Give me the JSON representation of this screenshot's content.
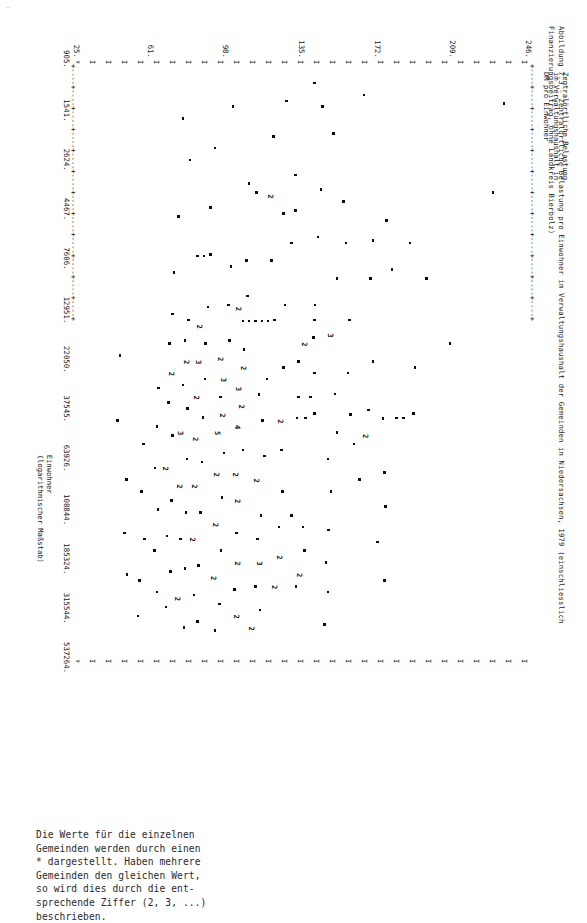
{
  "page": {
    "corner_mark": "…"
  },
  "figure": {
    "title": "Abbildung 7.3 - Zentralörtliche Belastung pro Einwohner im Verwaltungshaushalt der Gemeinden in Niedersachsen, 1979 (einschliesslich Finanzierungsbeitrag, ohne Landkreis Bierbolz)",
    "note": "Die Werte für die einzelnen\nGemeinden werden durch einen\n* dargestellt. Haben mehrere\nGemeinden den gleichen Wert,\nso wird dies durch die ent-\nsprechende Ziffer (2, 3, ...)\nbeschrieben.",
    "ylabel": "Zentralörtliche Belastung\nim Verwaltungshaushalt in\nDM pro Einwohner",
    "xlabel": "Einwohner\n(logarithmischer Maßstab)",
    "frame_char_top": "+----+----+----+----+----+----+----+----+----+----+----+----+",
    "frame_char_bottom": "+----+----+----+----+----+----+----+----+----+----+----+----+",
    "frame_char_side": "I I I I I I I I I I I I I I I I I I I I I I I I I I I I I I I I I I I I I I I I I I I I I",
    "point_marker_star": "*",
    "ink_color": "#111111"
  },
  "chart_data": {
    "type": "scatter",
    "title": "Abbildung 7.3 - Zentralörtliche Belastung pro Einwohner im Verwaltungshaushalt der Gemeinden in Niedersachsen, 1979 (einschliesslich Finanzierungsbeitrag, ohne Landkreis Bierbolz)",
    "xlabel": "Einwohner (logarithmischer Maßstab)",
    "ylabel": "Zentralörtliche Belastung im Verwaltungshaushalt in DM pro Einwohner",
    "xscale": "log",
    "yscale": "linear",
    "grid": false,
    "legend": null,
    "xticks": [
      905,
      1541,
      2624,
      4467,
      7606,
      12951,
      22050,
      37545,
      63926,
      108844,
      185324,
      315544,
      537264
    ],
    "xtick_labels": [
      "905.",
      "1541.",
      "2624.",
      "4467.",
      "7606.",
      "12951.",
      "22050.",
      "37545.",
      "63926.",
      "108844.",
      "185324.",
      "315544.",
      "537264."
    ],
    "yticks": [
      246,
      209,
      172,
      135,
      98,
      61,
      25
    ],
    "ytick_labels": [
      "246.",
      "209.",
      "172.",
      "135.",
      "98.",
      "61.",
      "25."
    ],
    "xlim": [
      905,
      537264
    ],
    "ylim": [
      25,
      246
    ],
    "marker": "*",
    "overplot_note": "Digits 2,3,4,5 denote the number of coincident municipalities at that cell.",
    "points": [
      {
        "x": 0.215,
        "y": 0.075,
        "m": "*"
      },
      {
        "x": 0.065,
        "y": 0.05,
        "m": "*"
      },
      {
        "x": 0.47,
        "y": 0.17,
        "m": "*"
      },
      {
        "x": 0.36,
        "y": 0.222,
        "m": "*"
      },
      {
        "x": 0.3,
        "y": 0.258,
        "m": "*"
      },
      {
        "x": 0.51,
        "y": 0.247,
        "m": "*"
      },
      {
        "x": 0.588,
        "y": 0.25,
        "m": "*"
      },
      {
        "x": 0.596,
        "y": 0.272,
        "m": "*"
      },
      {
        "x": 0.596,
        "y": 0.288,
        "m": "*"
      },
      {
        "x": 0.262,
        "y": 0.31,
        "m": "*"
      },
      {
        "x": 0.345,
        "y": 0.298,
        "m": "*"
      },
      {
        "x": 0.597,
        "y": 0.318,
        "m": "*"
      },
      {
        "x": 0.688,
        "y": 0.315,
        "m": "*"
      },
      {
        "x": 0.745,
        "y": 0.312,
        "m": "*"
      },
      {
        "x": 0.805,
        "y": 0.33,
        "m": "*"
      },
      {
        "x": 0.87,
        "y": 0.315,
        "m": "*"
      },
      {
        "x": 0.296,
        "y": 0.34,
        "m": "*"
      },
      {
        "x": 0.36,
        "y": 0.345,
        "m": "*"
      },
      {
        "x": 0.5,
        "y": 0.34,
        "m": "*"
      },
      {
        "x": 0.582,
        "y": 0.35,
        "m": "*"
      },
      {
        "x": 0.625,
        "y": 0.352,
        "m": "2"
      },
      {
        "x": 0.7,
        "y": 0.37,
        "m": "*"
      },
      {
        "x": 0.64,
        "y": 0.382,
        "m": "*"
      },
      {
        "x": 0.59,
        "y": 0.39,
        "m": "*"
      },
      {
        "x": 0.52,
        "y": 0.395,
        "m": "*"
      },
      {
        "x": 0.43,
        "y": 0.392,
        "m": "*"
      },
      {
        "x": 0.3,
        "y": 0.4,
        "m": "*"
      },
      {
        "x": 0.23,
        "y": 0.405,
        "m": "*"
      },
      {
        "x": 0.36,
        "y": 0.42,
        "m": "*"
      },
      {
        "x": 0.115,
        "y": 0.428,
        "m": "*"
      },
      {
        "x": 0.455,
        "y": 0.43,
        "m": "3"
      },
      {
        "x": 0.555,
        "y": 0.424,
        "m": "*"
      },
      {
        "x": 0.62,
        "y": 0.42,
        "m": "*"
      },
      {
        "x": 0.665,
        "y": 0.44,
        "m": "*"
      },
      {
        "x": 0.72,
        "y": 0.433,
        "m": "*"
      },
      {
        "x": 0.785,
        "y": 0.438,
        "m": "*"
      },
      {
        "x": 0.84,
        "y": 0.444,
        "m": "*"
      },
      {
        "x": 0.89,
        "y": 0.44,
        "m": "*"
      },
      {
        "x": 0.945,
        "y": 0.448,
        "m": "*"
      },
      {
        "x": 0.07,
        "y": 0.452,
        "m": "*"
      },
      {
        "x": 0.21,
        "y": 0.455,
        "m": "*"
      },
      {
        "x": 0.29,
        "y": 0.462,
        "m": "*"
      },
      {
        "x": 0.405,
        "y": 0.468,
        "m": "*"
      },
      {
        "x": 0.43,
        "y": 0.47,
        "m": "*"
      },
      {
        "x": 0.46,
        "y": 0.472,
        "m": "*"
      },
      {
        "x": 0.47,
        "y": 0.486,
        "m": "2"
      },
      {
        "x": 0.52,
        "y": 0.47,
        "m": "*"
      },
      {
        "x": 0.56,
        "y": 0.478,
        "m": "*"
      },
      {
        "x": 0.588,
        "y": 0.47,
        "m": "*"
      },
      {
        "x": 0.596,
        "y": 0.49,
        "m": "*"
      },
      {
        "x": 0.56,
        "y": 0.505,
        "m": "*"
      },
      {
        "x": 0.596,
        "y": 0.508,
        "m": "*"
      },
      {
        "x": 0.5,
        "y": 0.505,
        "m": "*"
      },
      {
        "x": 0.78,
        "y": 0.495,
        "m": "*"
      },
      {
        "x": 0.82,
        "y": 0.492,
        "m": "*"
      },
      {
        "x": 0.86,
        "y": 0.497,
        "m": "2"
      },
      {
        "x": 0.88,
        "y": 0.51,
        "m": "*"
      },
      {
        "x": 0.76,
        "y": 0.52,
        "m": "*"
      },
      {
        "x": 0.185,
        "y": 0.512,
        "m": "*"
      },
      {
        "x": 0.245,
        "y": 0.512,
        "m": "*"
      },
      {
        "x": 0.3,
        "y": 0.52,
        "m": "*"
      },
      {
        "x": 0.06,
        "y": 0.532,
        "m": "*"
      },
      {
        "x": 0.25,
        "y": 0.538,
        "m": "*"
      },
      {
        "x": 0.405,
        "y": 0.535,
        "m": "*"
      },
      {
        "x": 0.51,
        "y": 0.538,
        "m": "*"
      },
      {
        "x": 0.6,
        "y": 0.54,
        "m": "2"
      },
      {
        "x": 0.65,
        "y": 0.543,
        "m": "*"
      },
      {
        "x": 0.72,
        "y": 0.54,
        "m": "*"
      },
      {
        "x": 0.78,
        "y": 0.548,
        "m": "*"
      },
      {
        "x": 0.83,
        "y": 0.542,
        "m": "2"
      },
      {
        "x": 0.88,
        "y": 0.552,
        "m": "2"
      },
      {
        "x": 0.12,
        "y": 0.56,
        "m": "*"
      },
      {
        "x": 0.22,
        "y": 0.562,
        "m": "2"
      },
      {
        "x": 0.33,
        "y": 0.565,
        "m": "*"
      },
      {
        "x": 0.43,
        "y": 0.558,
        "m": "*"
      },
      {
        "x": 0.432,
        "y": 0.572,
        "m": "*"
      },
      {
        "x": 0.432,
        "y": 0.586,
        "m": "*"
      },
      {
        "x": 0.432,
        "y": 0.6,
        "m": "*"
      },
      {
        "x": 0.432,
        "y": 0.614,
        "m": "*"
      },
      {
        "x": 0.432,
        "y": 0.628,
        "m": "*"
      },
      {
        "x": 0.53,
        "y": 0.575,
        "m": "*"
      },
      {
        "x": 0.556,
        "y": 0.592,
        "m": "*"
      },
      {
        "x": 0.6,
        "y": 0.585,
        "m": "*"
      },
      {
        "x": 0.66,
        "y": 0.58,
        "m": "*"
      },
      {
        "x": 0.7,
        "y": 0.592,
        "m": "2"
      },
      {
        "x": 0.76,
        "y": 0.588,
        "m": "*"
      },
      {
        "x": 0.8,
        "y": 0.596,
        "m": "*"
      },
      {
        "x": 0.84,
        "y": 0.586,
        "m": "3"
      },
      {
        "x": 0.88,
        "y": 0.6,
        "m": "*"
      },
      {
        "x": 0.92,
        "y": 0.59,
        "m": "*"
      },
      {
        "x": 0.95,
        "y": 0.604,
        "m": "2"
      },
      {
        "x": 0.215,
        "y": 0.598,
        "m": "*"
      },
      {
        "x": 0.2,
        "y": 0.614,
        "m": "*"
      },
      {
        "x": 0.33,
        "y": 0.62,
        "m": "*"
      },
      {
        "x": 0.39,
        "y": 0.618,
        "m": "*"
      },
      {
        "x": 0.41,
        "y": 0.632,
        "m": "2"
      },
      {
        "x": 0.48,
        "y": 0.625,
        "m": "*"
      },
      {
        "x": 0.51,
        "y": 0.622,
        "m": "2"
      },
      {
        "x": 0.545,
        "y": 0.632,
        "m": "3"
      },
      {
        "x": 0.575,
        "y": 0.626,
        "m": "2"
      },
      {
        "x": 0.61,
        "y": 0.636,
        "m": "4"
      },
      {
        "x": 0.65,
        "y": 0.628,
        "m": "*"
      },
      {
        "x": 0.69,
        "y": 0.64,
        "m": "2"
      },
      {
        "x": 0.735,
        "y": 0.634,
        "m": "2"
      },
      {
        "x": 0.79,
        "y": 0.642,
        "m": "*"
      },
      {
        "x": 0.84,
        "y": 0.636,
        "m": "2"
      },
      {
        "x": 0.885,
        "y": 0.646,
        "m": "*"
      },
      {
        "x": 0.93,
        "y": 0.638,
        "m": "2"
      },
      {
        "x": 0.07,
        "y": 0.65,
        "m": "*"
      },
      {
        "x": 0.34,
        "y": 0.654,
        "m": "*"
      },
      {
        "x": 0.405,
        "y": 0.66,
        "m": "*"
      },
      {
        "x": 0.465,
        "y": 0.658,
        "m": "*"
      },
      {
        "x": 0.495,
        "y": 0.672,
        "m": "2"
      },
      {
        "x": 0.53,
        "y": 0.665,
        "m": "3"
      },
      {
        "x": 0.56,
        "y": 0.678,
        "m": "*"
      },
      {
        "x": 0.59,
        "y": 0.668,
        "m": "2"
      },
      {
        "x": 0.62,
        "y": 0.68,
        "m": "5"
      },
      {
        "x": 0.655,
        "y": 0.67,
        "m": "*"
      },
      {
        "x": 0.69,
        "y": 0.682,
        "m": "2"
      },
      {
        "x": 0.73,
        "y": 0.674,
        "m": "*"
      },
      {
        "x": 0.775,
        "y": 0.684,
        "m": "2"
      },
      {
        "x": 0.82,
        "y": 0.676,
        "m": "*"
      },
      {
        "x": 0.865,
        "y": 0.688,
        "m": "2"
      },
      {
        "x": 0.91,
        "y": 0.68,
        "m": "*"
      },
      {
        "x": 0.955,
        "y": 0.69,
        "m": "*"
      },
      {
        "x": 0.24,
        "y": 0.7,
        "m": "*"
      },
      {
        "x": 0.32,
        "y": 0.7,
        "m": "*"
      },
      {
        "x": 0.322,
        "y": 0.714,
        "m": "*"
      },
      {
        "x": 0.322,
        "y": 0.728,
        "m": "*"
      },
      {
        "x": 0.408,
        "y": 0.705,
        "m": "*"
      },
      {
        "x": 0.44,
        "y": 0.718,
        "m": "2"
      },
      {
        "x": 0.47,
        "y": 0.71,
        "m": "*"
      },
      {
        "x": 0.5,
        "y": 0.722,
        "m": "3"
      },
      {
        "x": 0.53,
        "y": 0.712,
        "m": "*"
      },
      {
        "x": 0.56,
        "y": 0.726,
        "m": "2"
      },
      {
        "x": 0.595,
        "y": 0.716,
        "m": "*"
      },
      {
        "x": 0.63,
        "y": 0.728,
        "m": "2"
      },
      {
        "x": 0.67,
        "y": 0.718,
        "m": "*"
      },
      {
        "x": 0.71,
        "y": 0.73,
        "m": "2"
      },
      {
        "x": 0.755,
        "y": 0.722,
        "m": "*"
      },
      {
        "x": 0.8,
        "y": 0.734,
        "m": "2"
      },
      {
        "x": 0.845,
        "y": 0.726,
        "m": "*"
      },
      {
        "x": 0.895,
        "y": 0.736,
        "m": "*"
      },
      {
        "x": 0.94,
        "y": 0.728,
        "m": "*"
      },
      {
        "x": 0.43,
        "y": 0.748,
        "m": "*"
      },
      {
        "x": 0.465,
        "y": 0.756,
        "m": "*"
      },
      {
        "x": 0.5,
        "y": 0.748,
        "m": "2"
      },
      {
        "x": 0.54,
        "y": 0.76,
        "m": "*"
      },
      {
        "x": 0.58,
        "y": 0.75,
        "m": "*"
      },
      {
        "x": 0.62,
        "y": 0.762,
        "m": "3"
      },
      {
        "x": 0.665,
        "y": 0.752,
        "m": "*"
      },
      {
        "x": 0.71,
        "y": 0.764,
        "m": "2"
      },
      {
        "x": 0.755,
        "y": 0.754,
        "m": "*"
      },
      {
        "x": 0.8,
        "y": 0.766,
        "m": "*"
      },
      {
        "x": 0.85,
        "y": 0.756,
        "m": "*"
      },
      {
        "x": 0.9,
        "y": 0.768,
        "m": "2"
      },
      {
        "x": 0.95,
        "y": 0.758,
        "m": "*"
      },
      {
        "x": 0.35,
        "y": 0.78,
        "m": "*"
      },
      {
        "x": 0.42,
        "y": 0.784,
        "m": "*"
      },
      {
        "x": 0.47,
        "y": 0.79,
        "m": "*"
      },
      {
        "x": 0.52,
        "y": 0.782,
        "m": "2"
      },
      {
        "x": 0.57,
        "y": 0.792,
        "m": "*"
      },
      {
        "x": 0.625,
        "y": 0.784,
        "m": "*"
      },
      {
        "x": 0.68,
        "y": 0.794,
        "m": "2"
      },
      {
        "x": 0.735,
        "y": 0.786,
        "m": "*"
      },
      {
        "x": 0.795,
        "y": 0.796,
        "m": "*"
      },
      {
        "x": 0.855,
        "y": 0.788,
        "m": "*"
      },
      {
        "x": 0.915,
        "y": 0.798,
        "m": "*"
      },
      {
        "x": 0.545,
        "y": 0.815,
        "m": "*"
      },
      {
        "x": 0.61,
        "y": 0.818,
        "m": "*"
      },
      {
        "x": 0.68,
        "y": 0.822,
        "m": "*"
      },
      {
        "x": 0.75,
        "y": 0.816,
        "m": "*"
      },
      {
        "x": 0.82,
        "y": 0.824,
        "m": "*"
      },
      {
        "x": 0.89,
        "y": 0.818,
        "m": "*"
      },
      {
        "x": 0.64,
        "y": 0.848,
        "m": "*"
      },
      {
        "x": 0.72,
        "y": 0.852,
        "m": "*"
      },
      {
        "x": 0.8,
        "y": 0.846,
        "m": "*"
      },
      {
        "x": 0.87,
        "y": 0.856,
        "m": "*"
      },
      {
        "x": 0.93,
        "y": 0.86,
        "m": "*"
      },
      {
        "x": 0.7,
        "y": 0.886,
        "m": "*"
      },
      {
        "x": 0.79,
        "y": 0.89,
        "m": "*"
      },
      {
        "x": 0.86,
        "y": 0.884,
        "m": "*"
      },
      {
        "x": 0.05,
        "y": 0.36,
        "m": "*"
      },
      {
        "x": 0.03,
        "y": 0.47,
        "m": "*"
      },
      {
        "x": 0.14,
        "y": 0.69,
        "m": "*"
      },
      {
        "x": 0.16,
        "y": 0.745,
        "m": "*"
      },
      {
        "x": 0.09,
        "y": 0.76,
        "m": "*"
      },
      {
        "x": 0.255,
        "y": 0.77,
        "m": "*"
      },
      {
        "x": 0.49,
        "y": 0.9,
        "m": "*"
      },
      {
        "x": 0.6,
        "y": 0.905,
        "m": "*"
      }
    ]
  }
}
